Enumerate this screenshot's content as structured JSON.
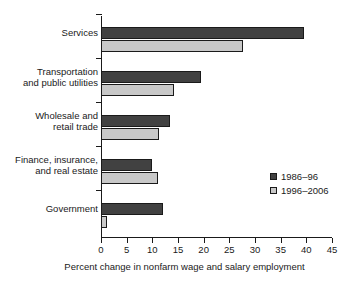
{
  "chart_data": {
    "type": "bar",
    "orientation": "horizontal",
    "title": "",
    "subtitle": "",
    "xlabel": "Percent change in nonfarm wage and salary employment",
    "ylabel": "",
    "xlim": [
      0,
      45
    ],
    "xticks": [
      0,
      5,
      10,
      15,
      20,
      25,
      30,
      35,
      40,
      45
    ],
    "xtick_labels": [
      "0",
      "5",
      "10",
      "15",
      "20",
      "25",
      "30",
      "35",
      "40",
      "45"
    ],
    "grid": false,
    "legend_position": "inside-right",
    "categories": [
      "Services",
      "Transportation and public utilities",
      "Wholesale and retail trade",
      "Finance, insurance, and real estate",
      "Government"
    ],
    "category_label_lines": [
      [
        "Services"
      ],
      [
        "Transportation",
        "and public utilities"
      ],
      [
        "Wholesale and",
        "retail trade"
      ],
      [
        "Finance, insurance,",
        "and real estate"
      ],
      [
        "Government"
      ]
    ],
    "series": [
      {
        "name": "1986–96",
        "color": "#414141",
        "values": [
          39.5,
          19.5,
          13.4,
          10.0,
          12.1
        ]
      },
      {
        "name": "1996–2006",
        "color": "#c8c8c8",
        "values": [
          27.7,
          14.2,
          11.3,
          11.2,
          1.2
        ]
      }
    ]
  },
  "legend": {
    "items": [
      {
        "label": "1986–96",
        "color": "#414141"
      },
      {
        "label": "1996–2006",
        "color": "#c8c8c8"
      }
    ]
  },
  "colors": {
    "series_0": "#414141",
    "series_1": "#c8c8c8",
    "axis": "#1a1a1a",
    "background": "#ffffff"
  }
}
